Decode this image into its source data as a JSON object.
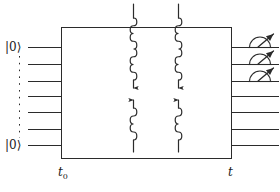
{
  "figure": {
    "type": "quantum-circuit-diagram",
    "stroke_color": "#2b2b2b",
    "background": "#ffffff",
    "width": 280,
    "height": 192
  },
  "labels": {
    "input_top": "|0⟩",
    "input_bottom": "|0⟩",
    "time_start": "t",
    "time_start_sub": "0",
    "time_end": "t"
  },
  "circuit": {
    "box": {
      "x": 61,
      "y": 27,
      "width": 170,
      "height": 131
    },
    "wire_count": 7,
    "wire_ys": [
      47,
      64,
      81,
      96,
      112,
      129,
      145
    ],
    "input_wire_x_start": 28,
    "output_wire_x_end": 279,
    "vertical_dots": {
      "x": 19,
      "y_top": 56,
      "y_bottom": 138
    },
    "measured_wire_indices": [
      0,
      1,
      2
    ],
    "photon_columns": [
      {
        "x": 133,
        "direction_top": "down",
        "direction_bottom": "up"
      },
      {
        "x": 178,
        "direction_top": "down",
        "direction_bottom": "up"
      }
    ]
  },
  "icons": {
    "meter": "measurement-meter-icon",
    "photon": "wavy-photon-line-icon",
    "arrow": "arrowhead-icon"
  }
}
